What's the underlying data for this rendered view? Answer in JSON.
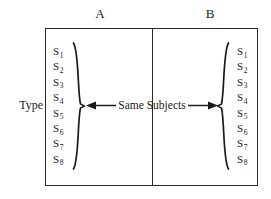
{
  "figure": {
    "row_label": "Type",
    "columns": [
      {
        "label": "A"
      },
      {
        "label": "B"
      }
    ],
    "center_caption": "Same Subjects",
    "subjects_left": [
      {
        "symbol": "S",
        "index": "1"
      },
      {
        "symbol": "S",
        "index": "2"
      },
      {
        "symbol": "S",
        "index": "3"
      },
      {
        "symbol": "S",
        "index": "4"
      },
      {
        "symbol": "S",
        "index": "5"
      },
      {
        "symbol": "S",
        "index": "6"
      },
      {
        "symbol": "S",
        "index": "7"
      },
      {
        "symbol": "S",
        "index": "8"
      }
    ],
    "subjects_right": [
      {
        "symbol": "S",
        "index": "1"
      },
      {
        "symbol": "S",
        "index": "2"
      },
      {
        "symbol": "S",
        "index": "3"
      },
      {
        "symbol": "S",
        "index": "4"
      },
      {
        "symbol": "S",
        "index": "5"
      },
      {
        "symbol": "S",
        "index": "6"
      },
      {
        "symbol": "S",
        "index": "7"
      },
      {
        "symbol": "S",
        "index": "8"
      }
    ],
    "colors": {
      "background": "#ffffff",
      "ink": "#1a1a1a",
      "rule": "#2a2a2a"
    }
  }
}
